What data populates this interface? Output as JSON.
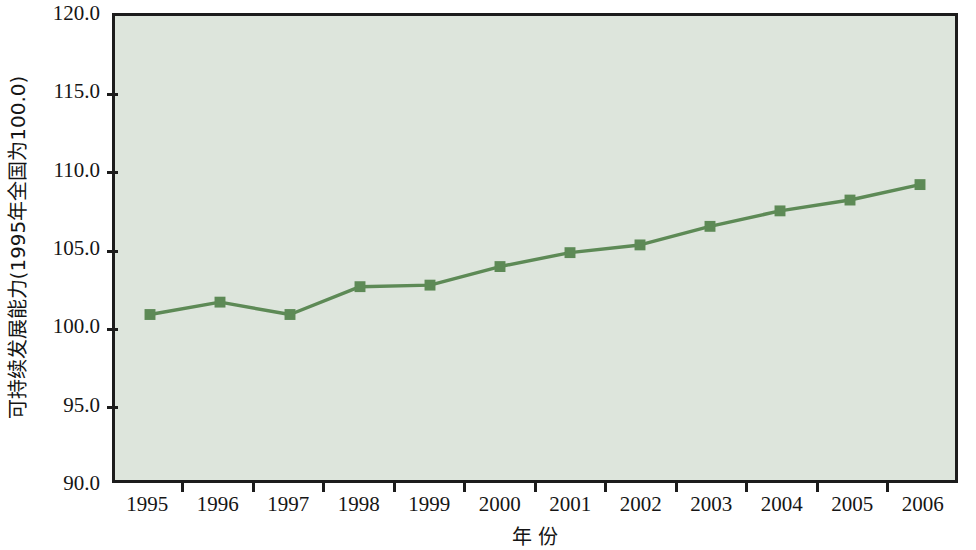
{
  "chart_data": {
    "type": "line",
    "title": "",
    "subtitle": "",
    "xlabel": "年 份",
    "ylabel": "可持续发展能力(1995年全国为100.0)",
    "categories": [
      "1995",
      "1996",
      "1997",
      "1998",
      "1999",
      "2000",
      "2001",
      "2002",
      "2003",
      "2004",
      "2005",
      "2006"
    ],
    "values": [
      100.7,
      101.5,
      100.7,
      102.5,
      102.6,
      103.8,
      104.7,
      105.2,
      106.4,
      107.4,
      108.1,
      109.1
    ],
    "series": [
      {
        "name": "可持续发展能力",
        "values": [
          100.7,
          101.5,
          100.7,
          102.5,
          102.6,
          103.8,
          104.7,
          105.2,
          106.4,
          107.4,
          108.1,
          109.1
        ]
      }
    ],
    "ylim": [
      90.0,
      120.0
    ],
    "ytick_labels": [
      "120.0",
      "115.0",
      "110.0",
      "105.0",
      "100.0",
      "95.0",
      "90.0"
    ],
    "ytick_values": [
      120.0,
      115.0,
      110.0,
      105.0,
      100.0,
      95.0,
      90.0
    ],
    "grid": false,
    "legend": "none",
    "marker": "square",
    "colors": {
      "line": "#5d8a56",
      "marker": "#5d8a56",
      "plot_background": "#dde5dc",
      "axis": "#1c1c1c",
      "page_background": "#ffffff",
      "text": "#151515"
    }
  }
}
